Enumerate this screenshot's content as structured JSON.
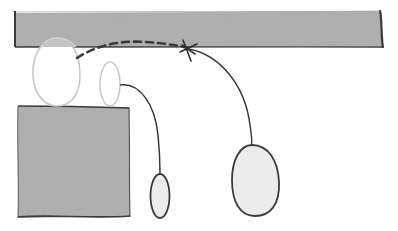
{
  "diagram": {
    "style": "hand-drawn sketch",
    "colors": {
      "background": "#ffffff",
      "fill_gray": "#b4b4b4",
      "stroke_dark": "#3a3a3a",
      "stroke_light": "#c8c8c8",
      "ellipse_fill": "#ececec"
    },
    "shapes": [
      {
        "id": "top-bar",
        "type": "rectangle",
        "fill": "gray"
      },
      {
        "id": "left-block",
        "type": "rectangle",
        "fill": "gray"
      },
      {
        "id": "faded-large-oval",
        "type": "ellipse",
        "outline": "light"
      },
      {
        "id": "faded-small-oval",
        "type": "ellipse",
        "outline": "light"
      },
      {
        "id": "small-dark-oval",
        "type": "ellipse",
        "outline": "dark"
      },
      {
        "id": "large-dark-oval",
        "type": "ellipse",
        "outline": "dark"
      },
      {
        "id": "anchor-star",
        "type": "star-mark"
      }
    ],
    "connectors": [
      {
        "from": "faded-large-oval",
        "to": "anchor-star",
        "style": "dashed"
      },
      {
        "from": "anchor-star",
        "to": "large-dark-oval",
        "style": "solid"
      },
      {
        "from": "faded-small-oval",
        "to": "small-dark-oval",
        "style": "solid"
      }
    ]
  }
}
